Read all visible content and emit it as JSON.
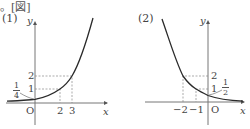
{
  "header": {
    "text": "。[図]"
  },
  "figures": [
    {
      "label": "(1)",
      "axes": {
        "x": "x",
        "y": "y",
        "origin": "O"
      },
      "y_ticks": [
        "1",
        "2"
      ],
      "x_ticks": [
        "2",
        "3"
      ],
      "intercept_fraction": {
        "num": "1",
        "den": "4"
      },
      "curve": "increasing exponential",
      "points": [
        {
          "x": 0,
          "y": 0.25
        },
        {
          "x": 2,
          "y": 1
        },
        {
          "x": 3,
          "y": 2
        }
      ]
    },
    {
      "label": "(2)",
      "axes": {
        "x": "x",
        "y": "y",
        "origin": "O"
      },
      "y_ticks": [
        "1",
        "2"
      ],
      "x_ticks": [
        "−2",
        "−1"
      ],
      "intercept_fraction": {
        "num": "1",
        "den": "2"
      },
      "curve": "decreasing exponential",
      "points": [
        {
          "x": -2,
          "y": 2
        },
        {
          "x": -1,
          "y": 1
        },
        {
          "x": 0,
          "y": 0.5
        }
      ]
    }
  ],
  "colors": {
    "curve": "#2a2a2a",
    "axis": "#777777",
    "dashed": "#888888"
  }
}
